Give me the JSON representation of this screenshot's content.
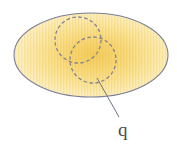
{
  "figure": {
    "kind": "venn-style-region-diagram",
    "background_color": "#ffffff",
    "canvas": {
      "width": 177,
      "height": 144
    },
    "region": {
      "name": "outer-ellipse",
      "shape": "ellipse",
      "cx": 91,
      "cy": 55,
      "rx": 77,
      "ry": 42,
      "stroke_color": "#7a7f96",
      "stroke_width": 1.1,
      "fill_center_color": "#f2c64a",
      "fill_mid_color": "#f7dd8e",
      "fill_edge_color": "#fdf8e0",
      "stripe_color": "#f6d87c",
      "stripe_opacity": 0.32
    },
    "circles": [
      {
        "name": "upper-left-circle",
        "cx": 78,
        "cy": 40,
        "r": 23,
        "stroke_color": "#83838f",
        "stroke_width": 1.3,
        "dash": "3.5 2.5",
        "fill": "none"
      },
      {
        "name": "lower-right-circle",
        "cx": 93,
        "cy": 60,
        "r": 23,
        "stroke_color": "#83838f",
        "stroke_width": 1.3,
        "dash": "3.5 2.5",
        "fill": "none"
      }
    ],
    "leader_line": {
      "name": "leader-line-q",
      "x1": 97,
      "y1": 78,
      "x2": 119,
      "y2": 117,
      "stroke_color": "#6f7382",
      "stroke_width": 1.0
    },
    "labels": [
      {
        "name": "label-q",
        "text": "q",
        "x": 118,
        "y": 136,
        "font_size": 19,
        "color": "#4a4a52"
      }
    ]
  }
}
